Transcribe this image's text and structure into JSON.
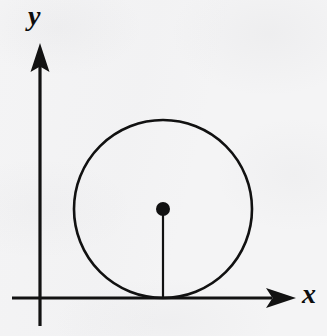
{
  "figure": {
    "background_color": "#f4f4f5",
    "ink_color": "#111111"
  },
  "axes": {
    "x_axis": {
      "label": "x",
      "label_style": "italic-serif",
      "orientation": "horizontal",
      "arrow": "right",
      "y_pixel": 298,
      "start_x_pixel": 12,
      "arrow_tip_x_pixel": 296
    },
    "y_axis": {
      "label": "y",
      "label_style": "italic-serif",
      "orientation": "vertical",
      "arrow": "up",
      "x_pixel": 40,
      "start_y_pixel": 326,
      "arrow_tip_y_pixel": 43
    },
    "origin": {
      "x_pixel": 40,
      "y_pixel": 298
    }
  },
  "shapes": {
    "circle": {
      "name": "circle",
      "center_x_pixel": 163,
      "center_y_pixel": 209,
      "radius_pixel": 89,
      "stroke_width": 2.6,
      "fill": "none",
      "tangent_to": "x-axis",
      "tangent_point_x_pixel": 163,
      "tangent_point_y_pixel": 298
    },
    "center_point": {
      "name": "center-point",
      "x_pixel": 163,
      "y_pixel": 209,
      "radius_pixel": 7,
      "fill": "#111111"
    },
    "radius_segment": {
      "name": "radius-segment",
      "from_x_pixel": 163,
      "from_y_pixel": 209,
      "to_x_pixel": 163,
      "to_y_pixel": 298,
      "stroke_width": 2.2,
      "length_pixel": 89
    }
  },
  "chart_data": {
    "type": "scatter",
    "xlabel": "x",
    "ylabel": "y",
    "grid": false,
    "legend": null,
    "annotations": [
      "circle of radius r centered above the x-axis",
      "vertical radius drawn from center down to the point of tangency"
    ],
    "series": [
      {
        "name": "circle",
        "kind": "circle",
        "center": [
          163,
          209
        ],
        "radius": 89
      },
      {
        "name": "center-point",
        "kind": "point",
        "x": [
          163
        ],
        "y": [
          209
        ]
      },
      {
        "name": "radius-segment",
        "kind": "line",
        "x": [
          163,
          163
        ],
        "y": [
          209,
          298
        ]
      }
    ]
  }
}
